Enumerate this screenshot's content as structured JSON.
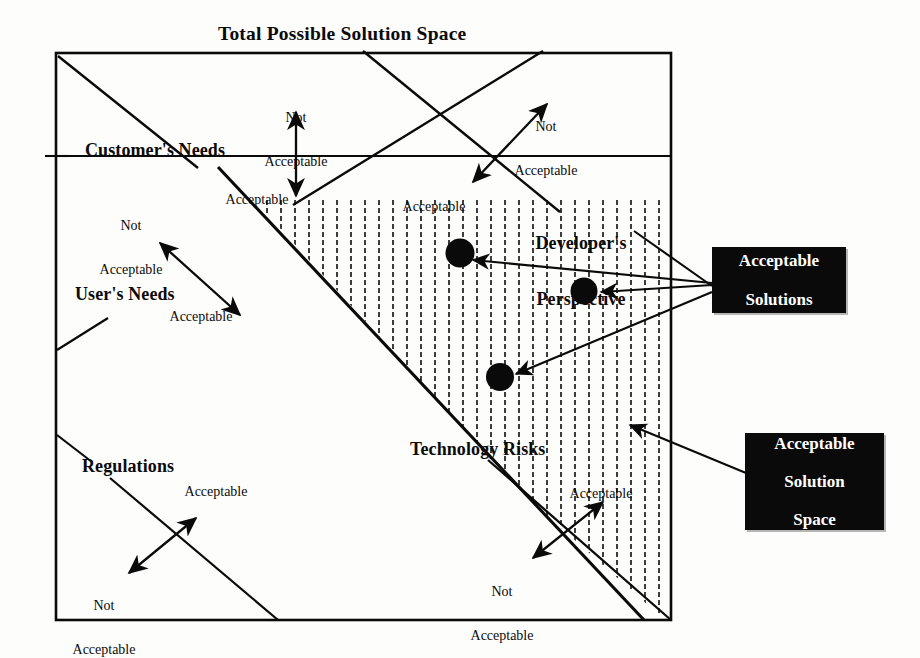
{
  "figure": {
    "type": "concept-diagram",
    "title": "Total Possible Solution Space",
    "background_color": "#fdfdfb",
    "line_color": "#0a0a0a",
    "hatch_color": "#1a1a1a",
    "callout_bg": "#0a0a0a",
    "callout_fg": "#ffffff"
  },
  "outer_box": {
    "label": "Total Possible Solution Space"
  },
  "regions": [
    {
      "id": "customers-needs",
      "label": "Customer's Needs",
      "acceptable_label": "Acceptable",
      "not_acceptable_label": "Not\nAcceptable"
    },
    {
      "id": "users-needs",
      "label": "User's Needs",
      "acceptable_label": "Acceptable",
      "not_acceptable_label": "Not\nAcceptable"
    },
    {
      "id": "regulations",
      "label": "Regulations",
      "acceptable_label": "Acceptable",
      "not_acceptable_label": "Not\nAcceptable"
    },
    {
      "id": "technology-risks",
      "label": "Technology Risks",
      "acceptable_label": "Acceptable",
      "not_acceptable_label": "Not\nAcceptable"
    },
    {
      "id": "developers-perspective",
      "label": "Developer's\nPerspective",
      "acceptable_label": "Acceptable",
      "not_acceptable_label": "Not\nAcceptable"
    }
  ],
  "labels": {
    "title": "Total Possible Solution Space",
    "customers_needs": "Customer's Needs",
    "users_needs": "User's Needs",
    "regulations": "Regulations",
    "technology_risks": "Technology Risks",
    "developers_perspective_line1": "Developer's",
    "developers_perspective_line2": "Perspective",
    "acceptable": "Acceptable",
    "not": "Not",
    "not_acceptable_line1": "Not",
    "not_acceptable_line2": "Acceptable"
  },
  "annotations": {
    "top_not_acceptable": {
      "line1": "Not",
      "line2": "Acceptable"
    },
    "top_right_not_acceptable": {
      "line1": "Not",
      "line2": "Acceptable"
    },
    "customers_acceptable": "Acceptable",
    "users_not_acceptable": {
      "line1": "Not",
      "line2": "Acceptable"
    },
    "users_acceptable": "Acceptable",
    "center_acceptable": "Acceptable",
    "regulations_acceptable": "Acceptable",
    "regulations_not_acceptable": {
      "line1": "Not",
      "line2": "Acceptable"
    },
    "technology_acceptable": "Acceptable",
    "technology_not_acceptable": {
      "line1": "Not",
      "line2": "Acceptable"
    }
  },
  "callouts": [
    {
      "id": "acceptable-solutions",
      "line1": "Acceptable",
      "line2": "Solutions",
      "line3": "",
      "points_to": "solution-dots"
    },
    {
      "id": "acceptable-solution-space",
      "line1": "Acceptable",
      "line2": "Solution",
      "line3": "Space",
      "points_to": "hatched-region"
    }
  ],
  "solution_points": [
    {
      "id": "solution-dot-1",
      "x": 460,
      "y": 253
    },
    {
      "id": "solution-dot-2",
      "x": 584,
      "y": 291
    },
    {
      "id": "solution-dot-3",
      "x": 500,
      "y": 377
    }
  ]
}
